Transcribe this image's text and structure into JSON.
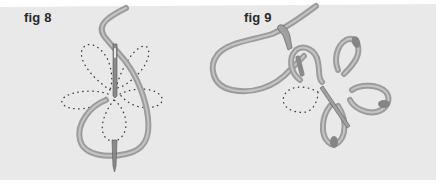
{
  "figures": [
    {
      "id": "fig8",
      "label": "fig 8",
      "description": "Needle brought up through center, thread looped around forming petal; dotted outline of flower with five petals"
    },
    {
      "id": "fig9",
      "label": "fig 9",
      "description": "Lazy daisy petals completed; needle working next petal, thread looped through"
    }
  ],
  "colors": {
    "background": "#e9e9e9",
    "thread": "#9c9c9c",
    "thread_highlight": "#c2c2c2",
    "needle": "#7a7a7a",
    "dots": "#3a3a3a",
    "label": "#2a2a2a"
  }
}
